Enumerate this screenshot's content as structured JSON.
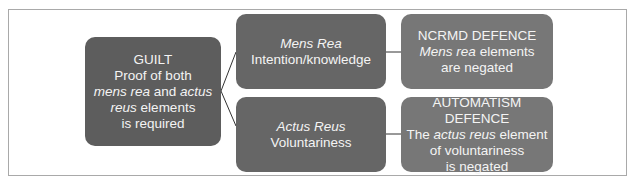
{
  "diagram": {
    "type": "flow",
    "colors": {
      "root_box": "#5d5d5d",
      "middle_box": "#666666",
      "right_box": "#777777",
      "text": "#f4f4f4",
      "connector": "#333333",
      "frame": "#a9a9a9"
    },
    "nodes": {
      "guilt": {
        "lines": [
          [
            {
              "text": "GUILT",
              "italic": false
            }
          ],
          [
            {
              "text": "Proof of both",
              "italic": false
            }
          ],
          [
            {
              "text": "mens rea",
              "italic": true
            },
            {
              "text": " and ",
              "italic": false
            },
            {
              "text": "actus",
              "italic": true
            }
          ],
          [
            {
              "text": "reus",
              "italic": true
            },
            {
              "text": " elements",
              "italic": false
            }
          ],
          [
            {
              "text": "is required",
              "italic": false
            }
          ]
        ]
      },
      "mens_rea": {
        "lines": [
          [
            {
              "text": "Mens Rea",
              "italic": true
            }
          ],
          [
            {
              "text": "Intention/knowledge",
              "italic": false
            }
          ]
        ]
      },
      "actus_reus": {
        "lines": [
          [
            {
              "text": "Actus Reus",
              "italic": true
            }
          ],
          [
            {
              "text": "Voluntariness",
              "italic": false
            }
          ]
        ]
      },
      "ncrmd": {
        "lines": [
          [
            {
              "text": "NCRMD DEFENCE",
              "italic": false
            }
          ],
          [
            {
              "text": "Mens rea",
              "italic": true
            },
            {
              "text": " elements",
              "italic": false
            }
          ],
          [
            {
              "text": "are negated",
              "italic": false
            }
          ]
        ]
      },
      "automatism": {
        "lines": [
          [
            {
              "text": "AUTOMATISM",
              "italic": false
            }
          ],
          [
            {
              "text": "DEFENCE",
              "italic": false
            }
          ],
          [
            {
              "text": "The ",
              "italic": false
            },
            {
              "text": "actus reus",
              "italic": true
            },
            {
              "text": " element",
              "italic": false
            }
          ],
          [
            {
              "text": "of voluntariness",
              "italic": false
            }
          ],
          [
            {
              "text": "is negated",
              "italic": false
            }
          ]
        ]
      }
    },
    "edges": [
      {
        "from": "guilt",
        "to": "mens_rea"
      },
      {
        "from": "guilt",
        "to": "actus_reus"
      },
      {
        "from": "mens_rea",
        "to": "ncrmd"
      },
      {
        "from": "actus_reus",
        "to": "automatism"
      }
    ]
  }
}
